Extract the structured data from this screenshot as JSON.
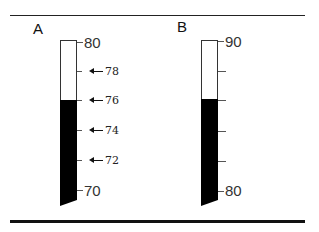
{
  "panels": [
    {
      "label": "A",
      "scale_max": "80",
      "scale_min": "70",
      "annotated_ticks": [
        "78",
        "76",
        "74",
        "72"
      ],
      "fill_level": 76
    },
    {
      "label": "B",
      "scale_max": "90",
      "scale_min": "80",
      "annotated_ticks": [],
      "fill_level": 86
    }
  ],
  "colors": {
    "fill": "#000000",
    "rule": "#111111"
  }
}
